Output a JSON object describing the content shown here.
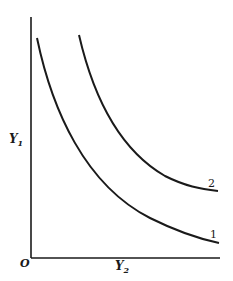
{
  "diagram": {
    "axes": {
      "y_label": "Y",
      "y_label_sub": "1",
      "x_label": "Y",
      "x_label_sub": "2",
      "origin_label": "O"
    },
    "curves": [
      {
        "label": "1",
        "description": "lower convex decreasing curve"
      },
      {
        "label": "2",
        "description": "upper convex decreasing curve"
      }
    ],
    "colors": {
      "line": "#1a1a1a",
      "background": "#ffffff"
    }
  }
}
